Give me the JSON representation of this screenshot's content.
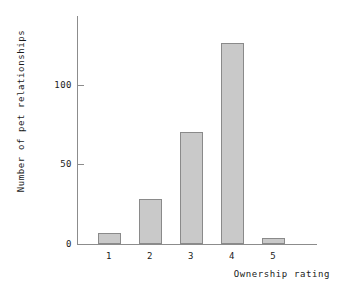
{
  "chart_data": {
    "type": "bar",
    "title": "",
    "xlabel": "Ownership rating",
    "ylabel": "Number of pet relationships",
    "categories": [
      "1",
      "2",
      "3",
      "4",
      "5"
    ],
    "values": [
      7,
      28,
      70,
      126,
      4
    ],
    "ylim": [
      0,
      143
    ],
    "yticks": [
      0,
      50,
      100
    ],
    "ytick_labels": [
      "0",
      "50",
      "100"
    ],
    "xtick_labels": [
      "1",
      "2",
      "3",
      "4",
      "5"
    ],
    "grid": false,
    "legend": null,
    "bar_color": "#c9c9c9",
    "bar_edge_color": "#8a8a8a",
    "axis_color": "#8c8c8c",
    "text_color": "#1a1a1a"
  },
  "axes": {
    "x_title": "Ownership rating",
    "y_title": "Number of pet relationships"
  },
  "ytick_labels": {
    "t0": "0",
    "t1": "50",
    "t2": "100"
  },
  "xtick_labels": {
    "c0": "1",
    "c1": "2",
    "c2": "3",
    "c3": "4",
    "c4": "5"
  }
}
